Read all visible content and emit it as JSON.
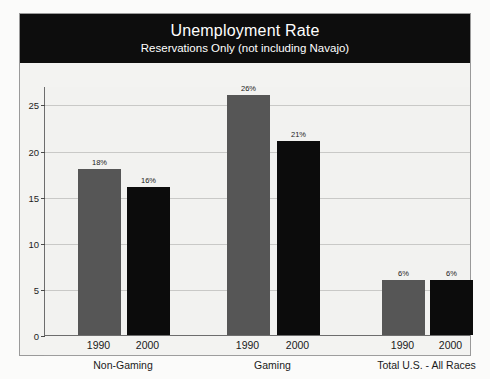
{
  "chart_data": {
    "type": "bar",
    "title": "Unemployment Rate",
    "subtitle": "Reservations Only (not including Navajo)",
    "xlabel": "",
    "ylabel": "",
    "ylim": [
      0,
      27
    ],
    "yticks": [
      0,
      5,
      10,
      15,
      20,
      25
    ],
    "ytick_labels": [
      "0",
      "5",
      "10",
      "15",
      "20",
      "25"
    ],
    "grid": true,
    "legend": "none",
    "categories": [
      "Non-Gaming",
      "Gaming",
      "Total U.S. - All Races"
    ],
    "series": [
      {
        "name": "1990",
        "values": [
          18,
          26,
          6
        ],
        "color": "#565656"
      },
      {
        "name": "2000",
        "values": [
          16,
          21,
          6
        ],
        "color": "#0c0c0c"
      }
    ],
    "bars": [
      {
        "group": "Non-Gaming",
        "year": "1990",
        "value": 18,
        "label": "18%",
        "color": "gray"
      },
      {
        "group": "Non-Gaming",
        "year": "2000",
        "value": 16,
        "label": "16%",
        "color": "black"
      },
      {
        "group": "Gaming",
        "year": "1990",
        "value": 26,
        "label": "26%",
        "color": "gray"
      },
      {
        "group": "Gaming",
        "year": "2000",
        "value": 21,
        "label": "21%",
        "color": "black"
      },
      {
        "group": "Total U.S. - All Races",
        "year": "1990",
        "value": 6,
        "label": "6%",
        "color": "gray"
      },
      {
        "group": "Total U.S. - All Races",
        "year": "2000",
        "value": 6,
        "label": "6%",
        "color": "black"
      }
    ]
  },
  "colors": {
    "banner_bg": "#0d0d0d",
    "banner_text": "#ffffff",
    "series_1990": "#565656",
    "series_2000": "#0c0c0c",
    "plot_bg": "#f2f2f0",
    "gridline": "#c9c9c7",
    "axis": "#6d6d6d"
  }
}
